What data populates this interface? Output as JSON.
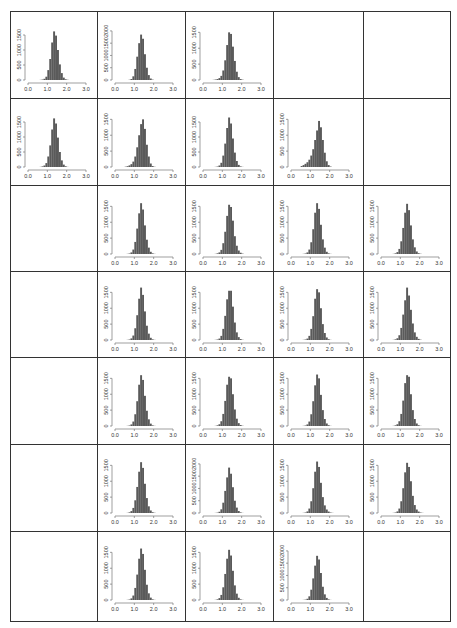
{
  "figure": {
    "layout": {
      "rows": 7,
      "cols": 5
    },
    "bar_color": "#5a5a5a",
    "border_color": "#333333"
  },
  "chart_data": {
    "type": "bar",
    "title": "",
    "xlabel": "",
    "ylabel": "",
    "xlim": [
      0.0,
      3.0
    ],
    "x_ticks": [
      "0.0",
      "1.0",
      "2.0",
      "3.0"
    ],
    "grid": false,
    "bin_width": 0.1,
    "bin_centers": [
      0.55,
      0.65,
      0.75,
      0.85,
      0.95,
      1.05,
      1.15,
      1.25,
      1.35,
      1.45,
      1.55,
      1.65,
      1.75,
      1.85,
      1.95,
      2.05,
      2.15
    ],
    "panels": [
      {
        "row": 1,
        "col": 1,
        "y_ticks": [
          "0",
          "500",
          "1000",
          "1500"
        ],
        "ylim": [
          0,
          1800
        ],
        "values": [
          0,
          5,
          15,
          40,
          110,
          330,
          700,
          1250,
          1620,
          1480,
          1000,
          520,
          230,
          80,
          25,
          8,
          0
        ]
      },
      {
        "row": 1,
        "col": 2,
        "y_ticks": [
          "0",
          "500",
          "1000",
          "1500",
          "2000"
        ],
        "ylim": [
          0,
          2200
        ],
        "values": [
          0,
          0,
          10,
          40,
          150,
          450,
          950,
          1500,
          1850,
          1680,
          1050,
          500,
          200,
          60,
          15,
          0,
          0
        ]
      },
      {
        "row": 1,
        "col": 3,
        "y_ticks": [
          "0",
          "500",
          "1000",
          "1500"
        ],
        "ylim": [
          0,
          1700
        ],
        "values": [
          5,
          15,
          30,
          60,
          130,
          300,
          620,
          1100,
          1500,
          1450,
          1050,
          600,
          260,
          90,
          30,
          10,
          0
        ]
      },
      {
        "row": 2,
        "col": 1,
        "y_ticks": [
          "0",
          "500",
          "1000",
          "1500"
        ],
        "ylim": [
          0,
          1800
        ],
        "values": [
          0,
          5,
          20,
          50,
          130,
          350,
          720,
          1250,
          1620,
          1450,
          980,
          500,
          220,
          80,
          25,
          5,
          0
        ]
      },
      {
        "row": 2,
        "col": 2,
        "y_ticks": [
          "0",
          "500",
          "1000",
          "1500"
        ],
        "ylim": [
          0,
          1700
        ],
        "values": [
          10,
          25,
          50,
          90,
          170,
          330,
          620,
          1000,
          1350,
          1500,
          1200,
          700,
          330,
          110,
          30,
          8,
          0
        ]
      },
      {
        "row": 2,
        "col": 3,
        "y_ticks": [
          "0",
          "500",
          "1000",
          "1500"
        ],
        "ylim": [
          0,
          1800
        ],
        "values": [
          0,
          5,
          15,
          50,
          140,
          380,
          780,
          1300,
          1650,
          1450,
          950,
          480,
          200,
          70,
          20,
          5,
          0
        ]
      },
      {
        "row": 2,
        "col": 4,
        "y_ticks": [
          "0",
          "500",
          "1000",
          "1500"
        ],
        "ylim": [
          0,
          1700
        ],
        "values": [
          30,
          60,
          100,
          150,
          230,
          360,
          560,
          850,
          1150,
          1450,
          1250,
          850,
          450,
          180,
          60,
          15,
          0
        ]
      },
      {
        "row": 3,
        "col": 2,
        "y_ticks": [
          "0",
          "500",
          "1000",
          "1500"
        ],
        "ylim": [
          0,
          1700
        ],
        "values": [
          0,
          5,
          15,
          50,
          140,
          380,
          800,
          1280,
          1600,
          1400,
          900,
          450,
          200,
          70,
          20,
          5,
          0
        ]
      },
      {
        "row": 3,
        "col": 3,
        "y_ticks": [
          "0",
          "500",
          "1000",
          "1500"
        ],
        "ylim": [
          0,
          1700
        ],
        "values": [
          0,
          5,
          20,
          50,
          130,
          340,
          700,
          1200,
          1550,
          1480,
          1050,
          560,
          260,
          110,
          40,
          12,
          0
        ]
      },
      {
        "row": 3,
        "col": 4,
        "y_ticks": [
          "0",
          "500",
          "1000",
          "1500"
        ],
        "ylim": [
          0,
          1700
        ],
        "values": [
          0,
          5,
          15,
          50,
          140,
          370,
          780,
          1300,
          1600,
          1420,
          920,
          460,
          200,
          70,
          20,
          5,
          0
        ]
      },
      {
        "row": 3,
        "col": 5,
        "y_ticks": [
          "0",
          "500",
          "1000",
          "1500"
        ],
        "ylim": [
          0,
          1700
        ],
        "values": [
          0,
          5,
          20,
          60,
          160,
          400,
          820,
          1300,
          1580,
          1380,
          900,
          460,
          210,
          80,
          25,
          8,
          0
        ]
      },
      {
        "row": 4,
        "col": 2,
        "y_ticks": [
          "0",
          "500",
          "1000",
          "1500"
        ],
        "ylim": [
          0,
          1700
        ],
        "values": [
          0,
          5,
          15,
          50,
          140,
          370,
          780,
          1300,
          1650,
          1420,
          900,
          450,
          200,
          70,
          20,
          5,
          0
        ]
      },
      {
        "row": 4,
        "col": 3,
        "y_ticks": [
          "0",
          "500",
          "1000",
          "1500"
        ],
        "ylim": [
          0,
          1700
        ],
        "values": [
          0,
          5,
          15,
          45,
          130,
          350,
          760,
          1280,
          1550,
          1550,
          1050,
          550,
          240,
          90,
          30,
          8,
          0
        ]
      },
      {
        "row": 4,
        "col": 4,
        "y_ticks": [
          "0",
          "500",
          "1000",
          "1500"
        ],
        "ylim": [
          0,
          1700
        ],
        "values": [
          0,
          5,
          15,
          45,
          130,
          350,
          750,
          1300,
          1600,
          1500,
          1000,
          500,
          220,
          80,
          25,
          5,
          0
        ]
      },
      {
        "row": 4,
        "col": 5,
        "y_ticks": [
          "0",
          "500",
          "1000",
          "1500"
        ],
        "ylim": [
          0,
          1700
        ],
        "values": [
          0,
          5,
          20,
          55,
          150,
          380,
          800,
          1250,
          1650,
          1400,
          950,
          520,
          240,
          100,
          35,
          10,
          0
        ]
      },
      {
        "row": 5,
        "col": 2,
        "y_ticks": [
          "0",
          "500",
          "1000",
          "1500"
        ],
        "ylim": [
          0,
          1700
        ],
        "values": [
          0,
          5,
          15,
          50,
          140,
          370,
          780,
          1300,
          1600,
          1450,
          950,
          480,
          210,
          75,
          20,
          5,
          0
        ]
      },
      {
        "row": 5,
        "col": 3,
        "y_ticks": [
          "0",
          "500",
          "1000",
          "1500"
        ],
        "ylim": [
          0,
          1700
        ],
        "values": [
          0,
          5,
          20,
          55,
          150,
          380,
          790,
          1300,
          1550,
          1500,
          1000,
          520,
          230,
          90,
          30,
          8,
          0
        ]
      },
      {
        "row": 5,
        "col": 4,
        "y_ticks": [
          "0",
          "500",
          "1000",
          "1500"
        ],
        "ylim": [
          0,
          1700
        ],
        "values": [
          0,
          5,
          15,
          50,
          140,
          370,
          780,
          1280,
          1620,
          1500,
          980,
          500,
          220,
          80,
          25,
          5,
          0
        ]
      },
      {
        "row": 5,
        "col": 5,
        "y_ticks": [
          "0",
          "500",
          "1000",
          "1500"
        ],
        "ylim": [
          0,
          1700
        ],
        "values": [
          0,
          5,
          20,
          55,
          150,
          380,
          800,
          1350,
          1600,
          1550,
          1000,
          500,
          220,
          80,
          25,
          5,
          0
        ]
      },
      {
        "row": 6,
        "col": 2,
        "y_ticks": [
          "0",
          "500",
          "1000",
          "1500"
        ],
        "ylim": [
          0,
          1700
        ],
        "values": [
          0,
          5,
          20,
          60,
          160,
          400,
          820,
          1300,
          1600,
          1420,
          920,
          470,
          210,
          80,
          25,
          8,
          0
        ]
      },
      {
        "row": 6,
        "col": 3,
        "y_ticks": [
          "0",
          "500",
          "1000",
          "1500",
          "2000"
        ],
        "ylim": [
          0,
          2200
        ],
        "values": [
          0,
          5,
          15,
          50,
          150,
          420,
          900,
          1450,
          1850,
          1600,
          1050,
          500,
          220,
          80,
          25,
          5,
          0
        ]
      },
      {
        "row": 6,
        "col": 4,
        "y_ticks": [
          "0",
          "500",
          "1000",
          "1500"
        ],
        "ylim": [
          0,
          1700
        ],
        "values": [
          0,
          5,
          15,
          50,
          140,
          370,
          780,
          1300,
          1620,
          1450,
          950,
          500,
          240,
          110,
          45,
          15,
          5
        ]
      },
      {
        "row": 6,
        "col": 5,
        "y_ticks": [
          "0",
          "500",
          "1000",
          "1500"
        ],
        "ylim": [
          0,
          1700
        ],
        "values": [
          0,
          5,
          15,
          50,
          140,
          370,
          780,
          1280,
          1580,
          1450,
          1000,
          540,
          250,
          110,
          45,
          15,
          5
        ]
      },
      {
        "row": 7,
        "col": 2,
        "y_ticks": [
          "0",
          "500",
          "1000",
          "1500"
        ],
        "ylim": [
          0,
          1700
        ],
        "values": [
          0,
          5,
          15,
          50,
          140,
          380,
          800,
          1300,
          1620,
          1450,
          950,
          480,
          210,
          75,
          20,
          5,
          0
        ]
      },
      {
        "row": 7,
        "col": 3,
        "y_ticks": [
          "0",
          "500",
          "1000",
          "1500"
        ],
        "ylim": [
          0,
          1700
        ],
        "values": [
          0,
          5,
          20,
          60,
          160,
          400,
          820,
          1300,
          1580,
          1400,
          920,
          460,
          200,
          70,
          20,
          5,
          0
        ]
      },
      {
        "row": 7,
        "col": 4,
        "y_ticks": [
          "0",
          "500",
          "1000",
          "1500",
          "2000"
        ],
        "ylim": [
          0,
          2200
        ],
        "values": [
          0,
          5,
          15,
          50,
          150,
          420,
          880,
          1400,
          1800,
          1650,
          1100,
          540,
          230,
          85,
          25,
          5,
          0
        ]
      }
    ]
  }
}
